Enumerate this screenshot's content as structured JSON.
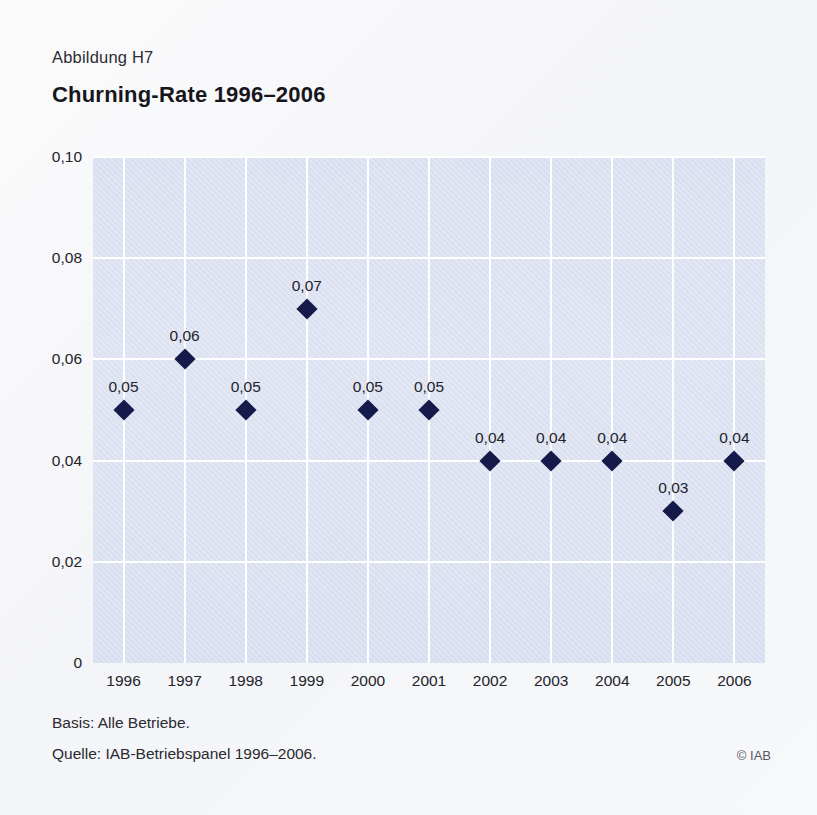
{
  "figure": {
    "label": "Abbildung H7",
    "title": "Churning-Rate 1996–2006"
  },
  "footer": {
    "basis": "Basis: Alle Betriebe.",
    "source": "Quelle: IAB-Betriebspanel 1996–2006.",
    "copyright": "© IAB"
  },
  "colors": {
    "marker": "#151a4a",
    "plot_background": "#dce1f0",
    "gridline": "#ffffff",
    "page_background": "#f7f8fa",
    "text": "#23232a"
  },
  "chart_data": {
    "type": "scatter",
    "title": "Churning-Rate 1996–2006",
    "xlabel": "",
    "ylabel": "",
    "categories": [
      "1996",
      "1997",
      "1998",
      "1999",
      "2000",
      "2001",
      "2002",
      "2003",
      "2004",
      "2005",
      "2006"
    ],
    "values": [
      0.05,
      0.06,
      0.05,
      0.07,
      0.05,
      0.05,
      0.04,
      0.04,
      0.04,
      0.03,
      0.04
    ],
    "point_labels": [
      "0,05",
      "0,06",
      "0,05",
      "0,07",
      "0,05",
      "0,05",
      "0,04",
      "0,04",
      "0,04",
      "0,03",
      "0,04"
    ],
    "ylim": [
      0,
      0.1
    ],
    "yticks": [
      0,
      0.02,
      0.04,
      0.06,
      0.08,
      0.1
    ],
    "ytick_labels": [
      "0",
      "0,02",
      "0,04",
      "0,06",
      "0,08",
      "0,10"
    ],
    "grid": true,
    "legend": null,
    "marker_shape": "diamond"
  }
}
